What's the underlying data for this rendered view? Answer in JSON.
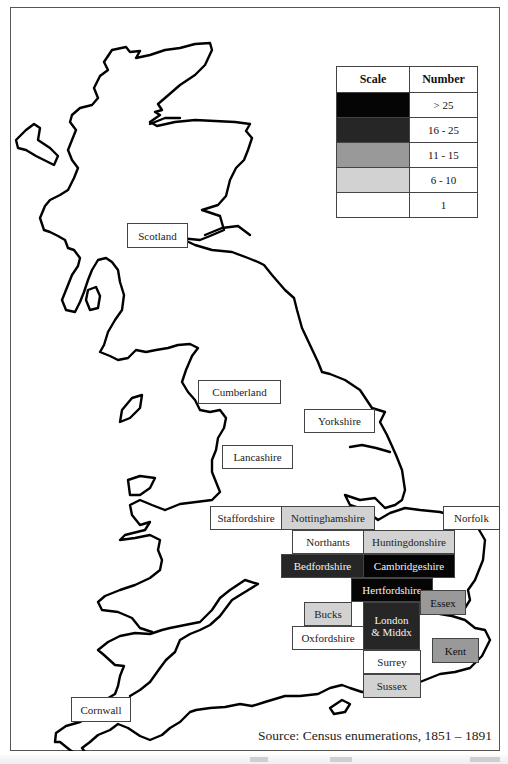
{
  "legend": {
    "headers": {
      "scale": "Scale",
      "number": "Number"
    },
    "rows": [
      {
        "color": "#050505",
        "label": "> 25"
      },
      {
        "color": "#262626",
        "label": "16 - 25"
      },
      {
        "color": "#999999",
        "label": "11 - 15"
      },
      {
        "color": "#d2d2d2",
        "label": "6 - 10"
      },
      {
        "color": "#ffffff",
        "label": "1"
      }
    ]
  },
  "regions": {
    "scotland": {
      "label": "Scotland",
      "category": "unshaded"
    },
    "cumberland": {
      "label": "Cumberland",
      "category": "unshaded"
    },
    "yorkshire": {
      "label": "Yorkshire",
      "category": "unshaded"
    },
    "lancashire": {
      "label": "Lancashire",
      "category": "unshaded"
    },
    "staffordshire": {
      "label": "Staffordshire",
      "category": "1"
    },
    "nottinghamshire": {
      "label": "Nottinghamshire",
      "category": "6 - 10"
    },
    "norfolk": {
      "label": "Norfolk",
      "category": "1"
    },
    "northants": {
      "label": "Northants",
      "category": "1"
    },
    "huntingdonshire": {
      "label": "Huntingdonshire",
      "category": "6 - 10"
    },
    "bedfordshire": {
      "label": "Bedfordshire",
      "category": "16 - 25"
    },
    "cambridgeshire": {
      "label": "Cambridgeshire",
      "category": "> 25"
    },
    "hertfordshire": {
      "label": "Hertfordshire",
      "category": "> 25"
    },
    "essex": {
      "label": "Essex",
      "category": "11 - 15"
    },
    "bucks": {
      "label": "Bucks",
      "category": "6 - 10"
    },
    "london_line1": {
      "label": "London"
    },
    "london_line2": {
      "label": "& Middx"
    },
    "london": {
      "category": "16 - 25"
    },
    "oxfordshire": {
      "label": "Oxfordshire",
      "category": "1"
    },
    "surrey": {
      "label": "Surrey",
      "category": "1"
    },
    "sussex": {
      "label": "Sussex",
      "category": "6 - 10"
    },
    "kent": {
      "label": "Kent",
      "category": "11 - 15"
    },
    "cornwall": {
      "label": "Cornwall",
      "category": "unshaded"
    }
  },
  "source": "Source: Census enumerations, 1851 – 1891"
}
